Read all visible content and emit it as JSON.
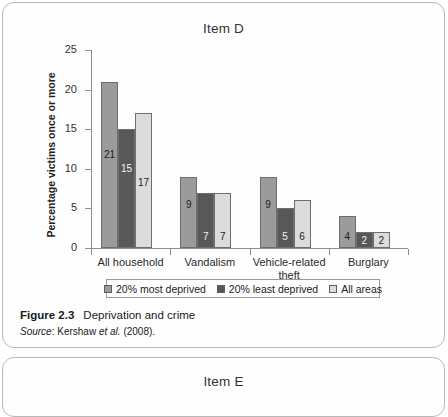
{
  "panels": [
    {
      "title": "Item D"
    },
    {
      "title": "Item E"
    }
  ],
  "figure": {
    "number": "Figure 2.3",
    "title": "Deprivation and crime",
    "source_word": "Source",
    "source_sep": ": Kershaw ",
    "source_etal": "et al.",
    "source_rest": " (2008)."
  },
  "chart_data": {
    "type": "bar",
    "title": "Item D",
    "xlabel": "",
    "ylabel": "Percentage victims once or more",
    "ylim": [
      0,
      25
    ],
    "yticks": [
      0,
      5,
      10,
      15,
      20,
      25
    ],
    "grid": false,
    "legend_position": "bottom",
    "categories": [
      "All household",
      "Vandalism",
      "Vehicle-related theft",
      "Burglary"
    ],
    "category_lines": [
      [
        "All household"
      ],
      [
        "Vandalism"
      ],
      [
        "Vehicle-related",
        "theft"
      ],
      [
        "Burglary"
      ]
    ],
    "series": [
      {
        "name": "20% most deprived",
        "color": "#9b9b9b",
        "values": [
          21,
          9,
          9,
          4
        ]
      },
      {
        "name": "20% least deprived",
        "color": "#585858",
        "values": [
          15,
          7,
          5,
          2
        ]
      },
      {
        "name": "All areas",
        "color": "#dcdcdc",
        "values": [
          17,
          7,
          6,
          2
        ]
      }
    ]
  },
  "colors": {
    "panel_border": "#b8b8b8",
    "axis": "#8d8d8d",
    "bar_outline": "#6e6e6e",
    "most_deprived": "#9b9b9b",
    "least_deprived": "#585858",
    "all_areas": "#dcdcdc"
  }
}
